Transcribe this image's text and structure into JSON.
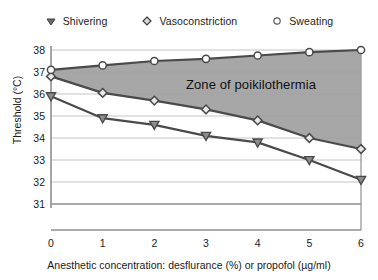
{
  "chart_data": {
    "type": "line",
    "title": "",
    "xlabel": "Anesthetic concentration: desflurance (%) or propofol (µg/ml)",
    "ylabel": "Threshold (°C)",
    "xlim": [
      0,
      6
    ],
    "ylim": [
      30.6,
      38.4
    ],
    "xticks": [
      "0",
      "1",
      "2",
      "3",
      "4",
      "5",
      "6"
    ],
    "yticks": [
      "31",
      "32",
      "33",
      "34",
      "35",
      "36",
      "37",
      "38"
    ],
    "x": [
      0,
      1,
      2,
      3,
      4,
      5,
      6
    ],
    "grid": true,
    "legend_position": "top",
    "series": [
      {
        "name": "Shivering",
        "marker": "triangle-down",
        "values": [
          35.9,
          34.9,
          34.6,
          34.1,
          33.8,
          33.0,
          32.1
        ]
      },
      {
        "name": "Vasoconstriction",
        "marker": "diamond",
        "values": [
          36.8,
          36.05,
          35.7,
          35.3,
          34.8,
          34.0,
          33.5
        ]
      },
      {
        "name": "Sweating",
        "marker": "circle-open",
        "values": [
          37.1,
          37.3,
          37.5,
          37.6,
          37.75,
          37.9,
          38.0
        ]
      }
    ],
    "annotations": [
      {
        "text": "Zone of poikilothermia",
        "x": 3.2,
        "y": 36.6,
        "description": "shaded band between Sweating and Vasoconstriction thresholds"
      }
    ],
    "shaded_band": {
      "label": "Zone of poikilothermia",
      "upper_series": "Sweating",
      "lower_series": "Vasoconstriction",
      "color": "#9e9e9e"
    },
    "colors": {
      "line": "#4a4a4a",
      "band_fill": "#a0a0a0",
      "axis": "#8f8f8f",
      "grid": "#bdbdbd",
      "text": "#1a1a1a"
    }
  },
  "legend": {
    "items": [
      {
        "label": "Shivering",
        "marker": "triangle-down-icon"
      },
      {
        "label": "Vasoconstriction",
        "marker": "diamond-icon"
      },
      {
        "label": "Sweating",
        "marker": "circle-open-icon"
      }
    ]
  },
  "axes": {
    "y_title": "Threshold (°C)",
    "x_title": "Anesthetic concentration: desflurance (%) or propofol (µg/ml)",
    "y_tick_labels": [
      "38",
      "37",
      "36",
      "35",
      "34",
      "33",
      "32",
      "31"
    ],
    "x_tick_labels": [
      "0",
      "1",
      "2",
      "3",
      "4",
      "5",
      "6"
    ]
  },
  "annotation": {
    "zone_label": "Zone of poikilothermia"
  }
}
